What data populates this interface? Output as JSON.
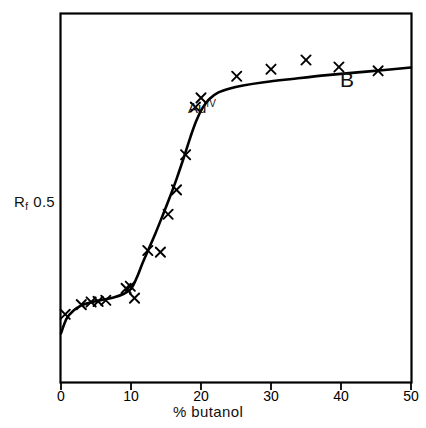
{
  "figure": {
    "panel_label": "B",
    "series_label_base": "Au",
    "series_label_sup": "IV",
    "y_axis_symbol": "R",
    "y_axis_subscript": "f",
    "y_axis_value": "0.5",
    "x_axis_title": "% butanol",
    "x_tick_labels": [
      "0",
      "10",
      "20",
      "30",
      "40",
      "50"
    ],
    "marker_glyph": "x",
    "line_color": "#000000",
    "marker_color": "#000000",
    "background_color": "#ffffff",
    "axis_color": "#000000"
  },
  "chart_data": {
    "type": "scatter",
    "title": "",
    "subtitle": "",
    "xlabel": "% butanol",
    "ylabel": "Rf",
    "xlim": [
      0,
      50
    ],
    "ylim": [
      0.38,
      1.06
    ],
    "grid": false,
    "legend": false,
    "panel": "B",
    "annotations": [
      {
        "text": "B",
        "x": 44.0,
        "y": 0.94
      },
      {
        "text": "Au IV",
        "x": 21.0,
        "y": 0.855
      }
    ],
    "axis_ticks": {
      "x": [
        0,
        10,
        20,
        30,
        40,
        50
      ],
      "y_labeled": [
        0.5
      ]
    },
    "series": [
      {
        "name": "Au IV",
        "marker": "x",
        "points_x": [
          0.6,
          2.9,
          4.3,
          5.3,
          6.4,
          9.3,
          9.9,
          10.5,
          12.4,
          14.2,
          15.3,
          16.5,
          17.8,
          19.2,
          20.0,
          25.1,
          30.0,
          35.0,
          39.7,
          45.3
        ],
        "points_y": [
          0.505,
          0.523,
          0.528,
          0.529,
          0.531,
          0.553,
          0.557,
          0.535,
          0.623,
          0.62,
          0.69,
          0.735,
          0.8,
          0.888,
          0.905,
          0.945,
          0.958,
          0.975,
          0.962,
          0.955
        ]
      }
    ],
    "fit_line": {
      "name": "fitted curve",
      "x": [
        0.0,
        0.8,
        1.8,
        3.0,
        4.5,
        6.0,
        7.5,
        9.0,
        10.0,
        10.8,
        11.6,
        12.5,
        13.5,
        14.5,
        15.5,
        16.5,
        17.5,
        18.5,
        19.3,
        20.2,
        21.2,
        22.5,
        24.0,
        26.0,
        29.0,
        33.0,
        38.0,
        44.0,
        50.0
      ],
      "y": [
        0.47,
        0.497,
        0.512,
        0.522,
        0.528,
        0.532,
        0.536,
        0.543,
        0.552,
        0.572,
        0.598,
        0.625,
        0.655,
        0.687,
        0.72,
        0.755,
        0.793,
        0.833,
        0.862,
        0.886,
        0.903,
        0.915,
        0.922,
        0.928,
        0.934,
        0.94,
        0.947,
        0.954,
        0.961
      ]
    }
  }
}
